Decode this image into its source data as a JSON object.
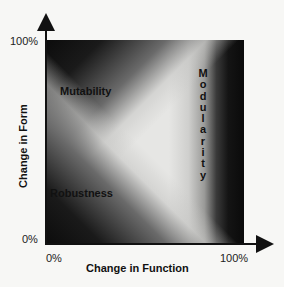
{
  "diagram": {
    "y_axis": {
      "label": "Change in Form",
      "tick_top": "100%",
      "tick_bottom": "0%"
    },
    "x_axis": {
      "label": "Change in Function",
      "tick_left": "0%",
      "tick_right": "100%"
    },
    "regions": {
      "mutability": "Mutability",
      "robustness": "Robustness",
      "modularity_letters": [
        "M",
        "o",
        "d",
        "u",
        "l",
        "a",
        "r",
        "i",
        "t",
        "y"
      ]
    },
    "colors": {
      "dark": "#0c0c0c",
      "light": "#e6e6e4",
      "background": "#f7f7f5"
    }
  }
}
